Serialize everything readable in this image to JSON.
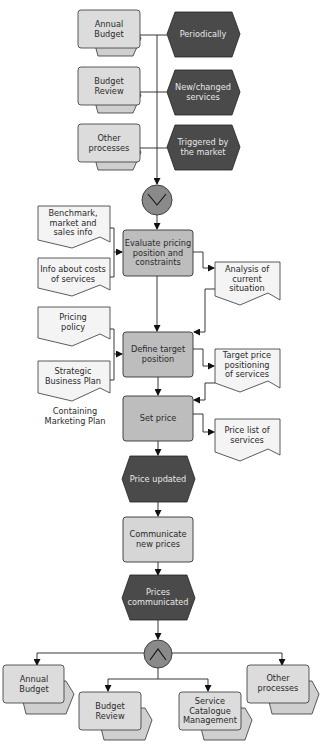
{
  "diagram": {
    "type": "event-driven process chain",
    "colors": {
      "event_fill": "#4a4a4a",
      "event_text": "#e8e8e8",
      "function_fill": "#bdbdbd",
      "interface_fill": "#dcdcdc",
      "document_fill": "#f4f4f4",
      "connector_fill": "#8a8a8a",
      "line": "#222222"
    },
    "start_interfaces": [
      {
        "label_lines": [
          "Annual",
          "Budget"
        ]
      },
      {
        "label_lines": [
          "Budget",
          "Review"
        ]
      },
      {
        "label_lines": [
          "Other",
          "processes"
        ]
      }
    ],
    "start_events": [
      {
        "label_lines": [
          "Periodically"
        ]
      },
      {
        "label_lines": [
          "New/changed",
          "services"
        ]
      },
      {
        "label_lines": [
          "Triggered by",
          "the market"
        ]
      }
    ],
    "xor_connector": {
      "symbol": "XOR"
    },
    "functions": [
      {
        "label_lines": [
          "Evaluate pricing",
          "position and",
          "constraints"
        ]
      },
      {
        "label_lines": [
          "Define target",
          "position"
        ]
      },
      {
        "label_lines": [
          "Set price"
        ]
      },
      {
        "label_lines": [
          "Communicate",
          "new prices"
        ]
      }
    ],
    "input_documents": [
      {
        "label_lines": [
          "Benchmark,",
          "market and",
          "sales info"
        ]
      },
      {
        "label_lines": [
          "Info about costs",
          "of services"
        ]
      },
      {
        "label_lines": [
          "Pricing",
          "policy"
        ]
      },
      {
        "label_lines": [
          "Strategic",
          "Business Plan"
        ]
      }
    ],
    "annotation": {
      "label_lines": [
        "Containing",
        "Marketing Plan"
      ]
    },
    "output_documents": [
      {
        "label_lines": [
          "Analysis of",
          "current",
          "situation"
        ]
      },
      {
        "label_lines": [
          "Target price",
          "positioning",
          "of services"
        ]
      },
      {
        "label_lines": [
          "Price list of",
          "services"
        ]
      }
    ],
    "events": [
      {
        "label_lines": [
          "Price updated"
        ]
      },
      {
        "label_lines": [
          "Prices",
          "communicated"
        ]
      }
    ],
    "and_connector": {
      "symbol": "AND"
    },
    "end_interfaces": [
      {
        "label_lines": [
          "Annual",
          "Budget"
        ]
      },
      {
        "label_lines": [
          "Budget",
          "Review"
        ]
      },
      {
        "label_lines": [
          "Service",
          "Catalogue",
          "Management"
        ]
      },
      {
        "label_lines": [
          "Other",
          "processes"
        ]
      }
    ]
  }
}
